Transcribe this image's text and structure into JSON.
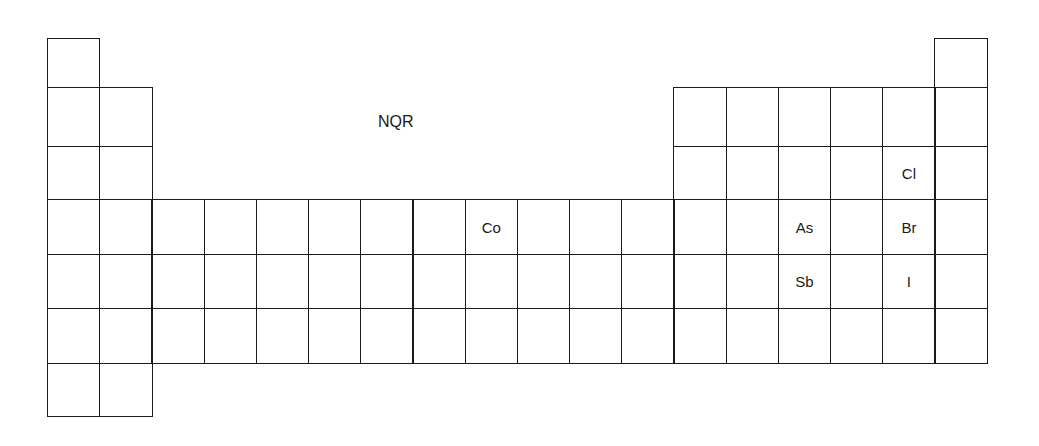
{
  "title": "NQR",
  "layout": {
    "left": 47,
    "cell_width": 52.2,
    "row_tops": [
      38,
      87,
      146,
      199,
      254,
      308,
      363,
      416
    ]
  },
  "grid": {
    "rows": [
      {
        "row": 1,
        "columns": [
          1,
          18
        ]
      },
      {
        "row": 2,
        "columns": [
          1,
          2,
          13,
          14,
          15,
          16,
          17,
          18
        ]
      },
      {
        "row": 3,
        "columns": [
          1,
          2,
          13,
          14,
          15,
          16,
          17,
          18
        ]
      },
      {
        "row": 4,
        "columns": [
          1,
          2,
          3,
          4,
          5,
          6,
          7,
          8,
          9,
          10,
          11,
          12,
          13,
          14,
          15,
          16,
          17,
          18
        ]
      },
      {
        "row": 5,
        "columns": [
          1,
          2,
          3,
          4,
          5,
          6,
          7,
          8,
          9,
          10,
          11,
          12,
          13,
          14,
          15,
          16,
          17,
          18
        ]
      },
      {
        "row": 6,
        "columns": [
          1,
          2,
          3,
          4,
          5,
          6,
          7,
          8,
          9,
          10,
          11,
          12,
          13,
          14,
          15,
          16,
          17,
          18
        ]
      },
      {
        "row": 7,
        "columns": [
          1,
          2
        ]
      }
    ]
  },
  "elements": [
    {
      "symbol": "Cl",
      "row": 3,
      "col": 17
    },
    {
      "symbol": "Co",
      "row": 4,
      "col": 9
    },
    {
      "symbol": "As",
      "row": 4,
      "col": 15
    },
    {
      "symbol": "Br",
      "row": 4,
      "col": 17
    },
    {
      "symbol": "Sb",
      "row": 5,
      "col": 15
    },
    {
      "symbol": "I",
      "row": 5,
      "col": 17
    }
  ]
}
